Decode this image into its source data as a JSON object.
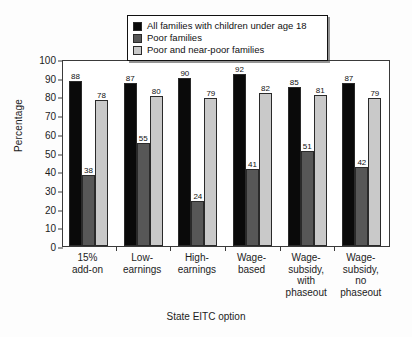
{
  "chart_data": {
    "type": "bar",
    "title": "",
    "xlabel": "State EITC option",
    "ylabel": "Percentage",
    "ylim": [
      0,
      100
    ],
    "ytick_step": 10,
    "yticks": [
      0,
      10,
      20,
      30,
      40,
      50,
      60,
      70,
      80,
      90,
      100
    ],
    "grid": false,
    "legend_position": "top-center",
    "categories": [
      "15%\nadd-on",
      "Low-\nearnings",
      "High-\nearnings",
      "Wage-\nbased",
      "Wage-\nsubsidy,\nwith\nphaseout",
      "Wage-\nsubsidy,\nno\nphaseout"
    ],
    "category_lines": [
      [
        "15%",
        "add-on"
      ],
      [
        "Low-",
        "earnings"
      ],
      [
        "High-",
        "earnings"
      ],
      [
        "Wage-",
        "based"
      ],
      [
        "Wage-",
        "subsidy,",
        "with",
        "phaseout"
      ],
      [
        "Wage-",
        "subsidy,",
        "no",
        "phaseout"
      ]
    ],
    "series": [
      {
        "name": "All families with children under age 18",
        "color": "#0a0a0a",
        "values": [
          88,
          87,
          90,
          92,
          85,
          87
        ]
      },
      {
        "name": "Poor families",
        "color": "#575757",
        "values": [
          38,
          55,
          24,
          41,
          51,
          42
        ]
      },
      {
        "name": "Poor and near-poor families",
        "color": "#c9c9c9",
        "values": [
          78,
          80,
          79,
          82,
          81,
          79
        ]
      }
    ]
  },
  "legend": {
    "items": [
      {
        "label": "All families with children under age 18",
        "color": "#0a0a0a"
      },
      {
        "label": "Poor families",
        "color": "#575757"
      },
      {
        "label": "Poor and near-poor families",
        "color": "#c9c9c9"
      }
    ]
  }
}
